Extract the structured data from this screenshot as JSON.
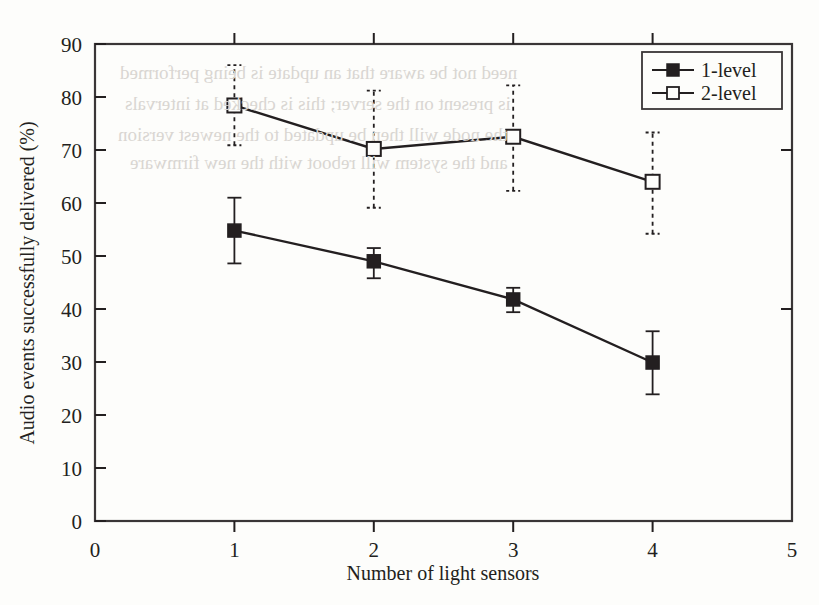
{
  "figure": {
    "background_color": "#fdfdfb",
    "ink_color": "#231f20"
  },
  "chart_data": {
    "type": "line",
    "title": "",
    "xlabel": "Number of light sensors",
    "ylabel": "Audio events successfully delivered (%)",
    "xlim": [
      0,
      5
    ],
    "ylim": [
      0,
      90
    ],
    "xticks": [
      "0",
      "1",
      "2",
      "3",
      "4",
      "5"
    ],
    "yticks": [
      "0",
      "10",
      "20",
      "30",
      "40",
      "50",
      "60",
      "70",
      "80",
      "90"
    ],
    "grid": false,
    "legend_position": "top-right",
    "x": [
      1,
      2,
      3,
      4
    ],
    "series": [
      {
        "name": "1-level",
        "marker": "filled-square",
        "errorbar_style": "solid",
        "values": [
          54.8,
          49.0,
          41.8,
          29.9
        ],
        "err_low": [
          48.6,
          45.8,
          39.4,
          23.9
        ],
        "err_high": [
          61.0,
          51.5,
          44.0,
          35.8
        ]
      },
      {
        "name": "2-level",
        "marker": "open-square",
        "errorbar_style": "dashed",
        "values": [
          78.4,
          70.2,
          72.5,
          64.0
        ],
        "err_low": [
          70.9,
          59.1,
          62.3,
          54.2
        ],
        "err_high": [
          86.0,
          81.2,
          82.2,
          73.3
        ]
      }
    ]
  },
  "legend": {
    "entries": [
      {
        "label": "1-level"
      },
      {
        "label": "2-level"
      }
    ]
  },
  "bleed_text": {
    "lines": [
      "need not be aware that an update is being performed",
      "is present on the server; this is checked at intervals",
      "the node will then be updated to the newest version",
      "and the system will reboot with the new firmware"
    ]
  }
}
